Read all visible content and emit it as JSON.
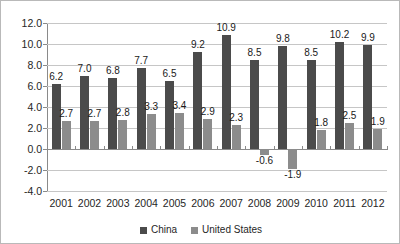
{
  "chart_data": {
    "type": "bar",
    "title": "",
    "xlabel": "",
    "ylabel": "",
    "ylim": [
      -4.0,
      12.0
    ],
    "ytick_step": 2.0,
    "grid": true,
    "legend_position": "bottom",
    "data_labels": true,
    "categories": [
      "2001",
      "2002",
      "2003",
      "2004",
      "2005",
      "2006",
      "2007",
      "2008",
      "2009",
      "2010",
      "2011",
      "2012"
    ],
    "yticks": [
      "12.0",
      "10.0",
      "8.0",
      "6.0",
      "4.0",
      "2.0",
      "0.0",
      "-2.0",
      "-4.0"
    ],
    "series": [
      {
        "name": "China",
        "color": "#4b4b4b",
        "values": [
          6.2,
          7.0,
          6.8,
          7.7,
          6.5,
          9.2,
          10.9,
          8.5,
          9.8,
          8.5,
          10.2,
          9.9
        ],
        "labels": [
          "6.2",
          "7.0",
          "6.8",
          "7.7",
          "6.5",
          "9.2",
          "10.9",
          "8.5",
          "9.8",
          "8.5",
          "10.2",
          "9.9"
        ]
      },
      {
        "name": "United States",
        "color": "#8c8c8c",
        "values": [
          2.7,
          2.7,
          2.8,
          3.3,
          3.4,
          2.9,
          2.3,
          -0.6,
          -1.9,
          1.8,
          2.5,
          1.9
        ],
        "labels": [
          "2.7",
          "2.7",
          "2.8",
          "3.3",
          "3.4",
          "2.9",
          "2.3",
          "-0.6",
          "-1.9",
          "1.8",
          "2.5",
          "1.9"
        ]
      }
    ]
  },
  "legend": {
    "items": [
      {
        "label": "China"
      },
      {
        "label": "United States"
      }
    ]
  }
}
